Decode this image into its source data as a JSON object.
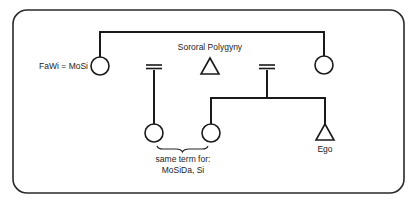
{
  "diagram": {
    "type": "kinship-chart",
    "title": "Sororal Polygyny",
    "labels": {
      "title": "Sororal Polygyny",
      "fawi_mosi": "FaWi = MoSi",
      "same_term_line1": "same term for:",
      "same_term_line2": "MoSiDa, Si",
      "ego": "Ego"
    },
    "nodes": [
      {
        "id": "fawi-mosi",
        "shape": "circle",
        "sex": "female",
        "label": "FaWi = MoSi"
      },
      {
        "id": "husband",
        "shape": "triangle",
        "sex": "male",
        "label": ""
      },
      {
        "id": "mother",
        "shape": "circle",
        "sex": "female",
        "label": ""
      },
      {
        "id": "mosida",
        "shape": "circle",
        "sex": "female",
        "label": ""
      },
      {
        "id": "sister",
        "shape": "circle",
        "sex": "female",
        "label": ""
      },
      {
        "id": "ego",
        "shape": "triangle",
        "sex": "male",
        "label": "Ego"
      }
    ],
    "relations": [
      {
        "type": "sibling",
        "members": [
          "fawi-mosi",
          "mother"
        ]
      },
      {
        "type": "marriage",
        "members": [
          "fawi-mosi",
          "husband"
        ]
      },
      {
        "type": "marriage",
        "members": [
          "husband",
          "mother"
        ]
      },
      {
        "type": "descent",
        "from": "fawi-mosi/husband",
        "to": [
          "mosida"
        ]
      },
      {
        "type": "descent",
        "from": "husband/mother",
        "to": [
          "sister",
          "ego"
        ]
      }
    ],
    "annotation": {
      "bracket_over": [
        "mosida",
        "sister"
      ],
      "text": "same term for: MoSiDa, Si"
    },
    "colors": {
      "ink": "#1a1a1a",
      "background": "#ffffff"
    }
  }
}
